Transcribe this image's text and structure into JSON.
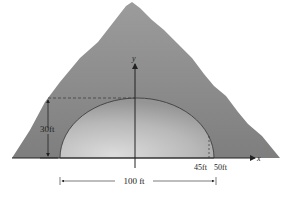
{
  "diagram": {
    "labels": {
      "height": "30ft",
      "x_inner": "45ft",
      "x_outer": "50ft",
      "width": "100 ft",
      "x_axis": "x",
      "y_axis": "y"
    },
    "values": {
      "tunnel_height_ft": 30,
      "tunnel_width_ft": 100,
      "half_width_ft": 50,
      "marked_x_ft": 45
    },
    "colors": {
      "mountain": "#8a8a8a",
      "tunnel_light": "#d8d8d8",
      "tunnel_dark": "#9a9a9a",
      "lines": "#222222"
    }
  }
}
